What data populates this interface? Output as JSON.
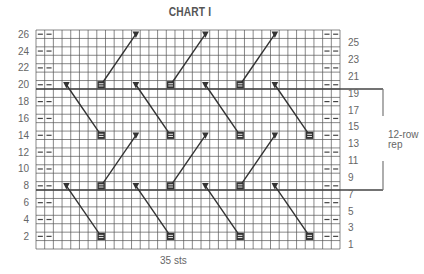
{
  "title": "CHART I",
  "footer": "35 sts",
  "repeat_label": [
    "12-row",
    "rep"
  ],
  "grid": {
    "cols": 35,
    "rows": 26,
    "x0": 36,
    "y0": 30,
    "x1": 340,
    "y1": 249,
    "left_row_labels": [
      26,
      24,
      22,
      20,
      18,
      16,
      14,
      12,
      10,
      8,
      6,
      4,
      2
    ],
    "right_row_labels": [
      25,
      23,
      21,
      19,
      17,
      15,
      13,
      11,
      9,
      7,
      5,
      3,
      1
    ],
    "thick_row_boundaries_below": [
      20,
      8
    ],
    "dash_cols": [
      1,
      2,
      34,
      35
    ],
    "repeat_rows": [
      8,
      19
    ],
    "colors": {
      "grid": "#555555",
      "symbol": "#333333",
      "label": "#666666",
      "bracket": "#777777"
    }
  },
  "symbols": {
    "legend": {
      "triangle": "purl-decrease-marker",
      "square": "double-bar-cell"
    },
    "cables": [
      {
        "from": {
          "type": "triangle",
          "col": 4,
          "row": 8
        },
        "to": {
          "type": "square",
          "col": 8,
          "row": 2
        }
      },
      {
        "from": {
          "type": "triangle",
          "col": 12,
          "row": 8
        },
        "to": {
          "type": "square",
          "col": 16,
          "row": 2
        }
      },
      {
        "from": {
          "type": "triangle",
          "col": 20,
          "row": 8
        },
        "to": {
          "type": "square",
          "col": 24,
          "row": 2
        }
      },
      {
        "from": {
          "type": "triangle",
          "col": 28,
          "row": 8
        },
        "to": {
          "type": "square",
          "col": 32,
          "row": 2
        }
      },
      {
        "from": {
          "type": "square",
          "col": 8,
          "row": 8
        },
        "to": {
          "type": "triangle",
          "col": 12,
          "row": 14
        }
      },
      {
        "from": {
          "type": "square",
          "col": 16,
          "row": 8
        },
        "to": {
          "type": "triangle",
          "col": 20,
          "row": 14
        }
      },
      {
        "from": {
          "type": "square",
          "col": 24,
          "row": 8
        },
        "to": {
          "type": "triangle",
          "col": 28,
          "row": 14
        }
      },
      {
        "from": {
          "type": "triangle",
          "col": 4,
          "row": 20
        },
        "to": {
          "type": "square",
          "col": 8,
          "row": 14
        }
      },
      {
        "from": {
          "type": "triangle",
          "col": 12,
          "row": 20
        },
        "to": {
          "type": "square",
          "col": 16,
          "row": 14
        }
      },
      {
        "from": {
          "type": "triangle",
          "col": 20,
          "row": 20
        },
        "to": {
          "type": "square",
          "col": 24,
          "row": 14
        }
      },
      {
        "from": {
          "type": "triangle",
          "col": 28,
          "row": 20
        },
        "to": {
          "type": "square",
          "col": 32,
          "row": 14
        }
      },
      {
        "from": {
          "type": "square",
          "col": 8,
          "row": 20
        },
        "to": {
          "type": "triangle",
          "col": 12,
          "row": 26
        }
      },
      {
        "from": {
          "type": "square",
          "col": 16,
          "row": 20
        },
        "to": {
          "type": "triangle",
          "col": 20,
          "row": 26
        }
      },
      {
        "from": {
          "type": "square",
          "col": 24,
          "row": 20
        },
        "to": {
          "type": "triangle",
          "col": 28,
          "row": 26
        }
      }
    ]
  }
}
